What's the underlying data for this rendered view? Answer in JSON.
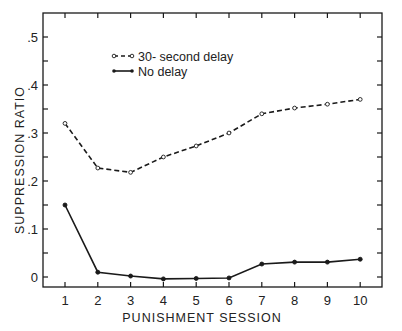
{
  "chart_data": {
    "type": "line",
    "title": "",
    "xlabel": "PUNISHMENT SESSION",
    "ylabel": "SUPPRESSION RATIO",
    "x": [
      1,
      2,
      3,
      4,
      5,
      6,
      7,
      8,
      9,
      10
    ],
    "x_tick_labels": [
      "1",
      "2",
      "3",
      "4",
      "5",
      "6",
      "7",
      "8",
      "9",
      "10"
    ],
    "y_tick_labels": [
      "0",
      ".1",
      ".2",
      ".3",
      ".4",
      ".5"
    ],
    "y_ticks": [
      0,
      0.1,
      0.2,
      0.3,
      0.4,
      0.5
    ],
    "ylim": [
      -0.02,
      0.55
    ],
    "xlim": [
      0.35,
      10.65
    ],
    "grid": false,
    "legend_position": "upper left",
    "series": [
      {
        "name": "30-second delay",
        "style": "dashed, open circles",
        "values": [
          0.32,
          0.227,
          0.218,
          0.25,
          0.273,
          0.3,
          0.34,
          0.352,
          0.36,
          0.37
        ]
      },
      {
        "name": "No delay",
        "style": "solid, filled circles",
        "values": [
          0.15,
          0.01,
          0.002,
          -0.004,
          -0.003,
          -0.002,
          0.027,
          0.031,
          0.031,
          0.037
        ]
      }
    ]
  },
  "legend": {
    "items": [
      {
        "label": "30- second delay"
      },
      {
        "label": "No delay"
      }
    ]
  },
  "axes": {
    "x_title": "PUNISHMENT SESSION",
    "y_title": "SUPPRESSION RATIO"
  },
  "colors": {
    "line": "#1a1a1a",
    "background": "#ffffff"
  }
}
